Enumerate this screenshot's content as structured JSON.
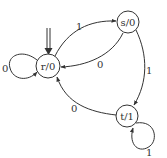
{
  "diagram": {
    "type": "finite-state-machine (Moore)",
    "start_state": "r",
    "states": [
      {
        "id": "r",
        "label": "r/0"
      },
      {
        "id": "s",
        "label": "s/0"
      },
      {
        "id": "t",
        "label": "t/1"
      }
    ],
    "transitions": [
      {
        "from": "r",
        "to": "r",
        "label": "0"
      },
      {
        "from": "r",
        "to": "s",
        "label": "1"
      },
      {
        "from": "s",
        "to": "r",
        "label": "0"
      },
      {
        "from": "s",
        "to": "t",
        "label": "1"
      },
      {
        "from": "t",
        "to": "r",
        "label": "0"
      },
      {
        "from": "t",
        "to": "t",
        "label": "1"
      }
    ]
  },
  "colors": {
    "stroke": "#333333",
    "background": "#ffffff"
  }
}
